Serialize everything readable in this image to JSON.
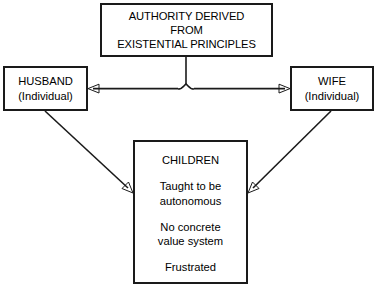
{
  "diagram": {
    "stroke_color": "#1a1a1a",
    "background_color": "#ffffff",
    "nodes": {
      "authority": {
        "name": "authority-box",
        "lines": [
          "AUTHORITY DERIVED",
          "FROM",
          "EXISTENTIAL PRINCIPLES"
        ]
      },
      "husband": {
        "name": "husband-box",
        "title": "HUSBAND",
        "subtitle": "(Individual)"
      },
      "wife": {
        "name": "wife-box",
        "title": "WIFE",
        "subtitle": "(Individual)"
      },
      "children": {
        "name": "children-box",
        "title": "CHILDREN",
        "trait_1_line_1": "Taught to be",
        "trait_1_line_2": "autonomous",
        "trait_2_line_1": "No concrete",
        "trait_2_line_2": "value system",
        "trait_3": "Frustrated"
      }
    },
    "connectors": [
      {
        "name": "authority-to-spouses-stem",
        "from": "authority",
        "to": "spouse-axis",
        "style": "brace-stem",
        "arrowheads": "none"
      },
      {
        "name": "spouse-axis-to-husband",
        "from": "authority",
        "to": "husband",
        "style": "horizontal",
        "arrowheads": "left"
      },
      {
        "name": "spouse-axis-to-wife",
        "from": "authority",
        "to": "wife",
        "style": "horizontal",
        "arrowheads": "right"
      },
      {
        "name": "husband-to-children",
        "from": "husband",
        "to": "children",
        "style": "diagonal",
        "arrowheads": "end"
      },
      {
        "name": "wife-to-children",
        "from": "wife",
        "to": "children",
        "style": "diagonal",
        "arrowheads": "end"
      }
    ]
  }
}
